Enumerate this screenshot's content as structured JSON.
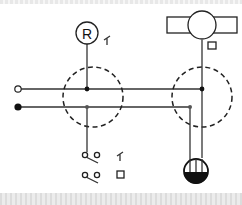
{
  "diagram": {
    "type": "schematic",
    "relay_label": "R",
    "terminals": [
      {
        "name": "open-terminal",
        "style": "hollow"
      },
      {
        "name": "closed-terminal",
        "style": "filled"
      }
    ],
    "junction_boxes": 2,
    "switch_symbols": [
      {
        "name": "switch-1",
        "marker": "relay-contact"
      },
      {
        "name": "switch-2",
        "marker": "square"
      }
    ],
    "components": [
      "relay-R",
      "motor-rotor",
      "junction-box-left",
      "junction-box-right",
      "lamp-valve"
    ],
    "colors": {
      "line": "#333333",
      "background": "#ffffff",
      "fill": "#111111"
    }
  }
}
